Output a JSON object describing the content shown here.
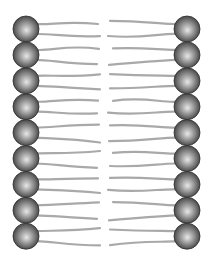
{
  "diagram": {
    "type": "phospholipid bilayer illustration",
    "colors": {
      "background": "#ffffff",
      "head_light": "#e6e6e6",
      "head_mid": "#8a8a8a",
      "head_dark": "#3c3c3c",
      "tail": "#a9a9a9"
    },
    "layout": {
      "rows": 9,
      "head_radius": 13,
      "left_head_x": 26,
      "right_head_x": 187,
      "first_row_y": 29,
      "row_spacing": 25.9
    },
    "leaflets": [
      {
        "name": "left-leaflet",
        "side": "left",
        "phospholipids": 9
      },
      {
        "name": "right-leaflet",
        "side": "right",
        "phospholipids": 9
      }
    ]
  }
}
